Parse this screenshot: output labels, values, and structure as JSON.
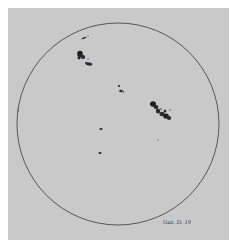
{
  "figure": {
    "type": "sunspot-drawing",
    "caption": "Gaz. D. 19",
    "colors": {
      "paper": "#c9c9c9",
      "margin": "#ffffff",
      "ink": "#2a2a2a",
      "limb": "#4a4a4a"
    },
    "solar_disk": {
      "cx": 118,
      "cy": 124,
      "r": 101
    },
    "spot_groups": [
      {
        "name": "north-east-small-streak",
        "x": 84,
        "y": 37
      },
      {
        "name": "north-east-group",
        "x": 85,
        "y": 58,
        "label": "a"
      },
      {
        "name": "central-pair",
        "x": 121,
        "y": 90
      },
      {
        "name": "west-large-group",
        "x": 163,
        "y": 113,
        "label": "a"
      },
      {
        "name": "southern-spot-upper",
        "x": 101,
        "y": 129
      },
      {
        "name": "southern-spot-lower",
        "x": 100,
        "y": 153
      },
      {
        "name": "isolated-pore",
        "x": 158,
        "y": 140
      }
    ]
  }
}
